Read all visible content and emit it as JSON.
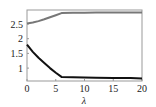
{
  "chart_data": {
    "type": "line",
    "title": "",
    "xlabel": "λ",
    "ylabel": "",
    "xlim": [
      0,
      20
    ],
    "ylim": [
      0.6,
      2.97
    ],
    "grid": false,
    "legend": null,
    "x_ticks": [
      0,
      5,
      10,
      15,
      20
    ],
    "x_tick_labels": [
      "0",
      "5",
      "10",
      "15",
      "20"
    ],
    "y_ticks": [
      1,
      1.5,
      2,
      2.5
    ],
    "y_tick_labels": [
      "1",
      "1.5",
      "2",
      "2.5"
    ],
    "series": [
      {
        "name": "upper",
        "color": "#777777",
        "x": [
          0,
          1,
          2,
          3,
          4,
          5,
          6,
          8,
          10,
          12,
          15,
          18,
          20
        ],
        "values": [
          2.52,
          2.55,
          2.6,
          2.66,
          2.73,
          2.8,
          2.87,
          2.88,
          2.88,
          2.89,
          2.89,
          2.89,
          2.89
        ]
      },
      {
        "name": "lower",
        "color": "#111111",
        "x": [
          0,
          1,
          2,
          3,
          4,
          5,
          6,
          8,
          10,
          12,
          15,
          18,
          20
        ],
        "values": [
          1.8,
          1.55,
          1.35,
          1.17,
          1.0,
          0.84,
          0.7,
          0.69,
          0.68,
          0.67,
          0.66,
          0.66,
          0.65
        ]
      }
    ]
  }
}
